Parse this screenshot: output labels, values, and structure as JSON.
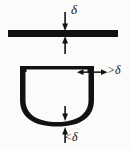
{
  "figure": {
    "background_color": "#fbfbfa",
    "ink_color": "#121212",
    "width": 130,
    "height": 149,
    "labels": {
      "delta_top": "δ",
      "greater_than_delta": ">δ",
      "less_than_delta": "<δ"
    },
    "parts": {
      "flat_bar": {
        "name": "flat-plate",
        "x": 8,
        "y": 30,
        "width": 110,
        "height": 7
      },
      "u_channel": {
        "name": "u-shaped-channel",
        "left": 20,
        "right": 94,
        "top": 66,
        "bottom": 126,
        "wall_thickness": 8,
        "floor_thickness": 4
      }
    },
    "annotations": [
      {
        "id": "thickness-delta",
        "symbol": "δ",
        "target": "flat-plate thickness",
        "arrows": "two opposed vertical arrows meeting at the plate"
      },
      {
        "id": "wall-greater-delta",
        "symbol": ">δ",
        "target": "u-channel side wall thickness",
        "arrows": "two opposed horizontal arrows across the right wall"
      },
      {
        "id": "floor-less-delta",
        "symbol": "<δ",
        "target": "u-channel bottom thickness",
        "arrows": "two opposed vertical arrows across the bottom"
      }
    ]
  }
}
